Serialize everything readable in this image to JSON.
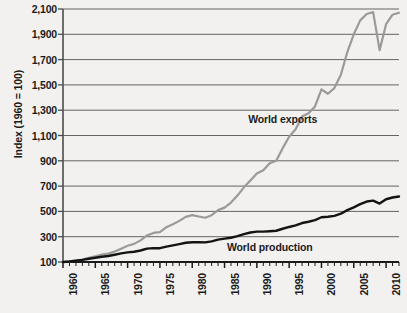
{
  "chart_data": {
    "type": "line",
    "title": "",
    "xlabel": "",
    "ylabel": "Index (1960 = 100)",
    "ylim": [
      100,
      2100
    ],
    "xlim": [
      1960,
      2012
    ],
    "yticks": [
      "100",
      "300",
      "500",
      "700",
      "900",
      "1,100",
      "1,300",
      "1,500",
      "1,700",
      "1,900",
      "2,100"
    ],
    "ytick_values": [
      100,
      300,
      500,
      700,
      900,
      1100,
      1300,
      1500,
      1700,
      1900,
      2100
    ],
    "xticks": [
      "1960",
      "1965",
      "1970",
      "1975",
      "1980",
      "1985",
      "1990",
      "1995",
      "2000",
      "2005",
      "2010"
    ],
    "xtick_values": [
      1960,
      1965,
      1970,
      1975,
      1980,
      1985,
      1990,
      1995,
      2000,
      2005,
      2010
    ],
    "minor_xtick_interval": 1,
    "grid": "horizontal",
    "legend": "inline-annotations",
    "x": [
      1960,
      1961,
      1962,
      1963,
      1964,
      1965,
      1966,
      1967,
      1968,
      1969,
      1970,
      1971,
      1972,
      1973,
      1974,
      1975,
      1976,
      1977,
      1978,
      1979,
      1980,
      1981,
      1982,
      1983,
      1984,
      1985,
      1986,
      1987,
      1988,
      1989,
      1990,
      1991,
      1992,
      1993,
      1994,
      1995,
      1996,
      1997,
      1998,
      1999,
      2000,
      2001,
      2002,
      2003,
      2004,
      2005,
      2006,
      2007,
      2008,
      2009,
      2010,
      2011,
      2012
    ],
    "series": [
      {
        "name": "World exports",
        "color": "#9a9a9a",
        "values": [
          100,
          105,
          112,
          120,
          133,
          145,
          158,
          166,
          183,
          205,
          228,
          243,
          271,
          310,
          330,
          336,
          375,
          398,
          425,
          457,
          470,
          460,
          450,
          470,
          510,
          530,
          570,
          625,
          690,
          745,
          800,
          825,
          880,
          900,
          1000,
          1090,
          1150,
          1250,
          1275,
          1330,
          1465,
          1430,
          1475,
          1580,
          1760,
          1900,
          2010,
          2060,
          2075,
          1775,
          1980,
          2055,
          2070
        ]
      },
      {
        "name": "World production",
        "color": "#141414",
        "values": [
          100,
          104,
          110,
          117,
          126,
          134,
          142,
          147,
          157,
          168,
          176,
          181,
          191,
          206,
          210,
          209,
          222,
          231,
          241,
          252,
          256,
          256,
          255,
          263,
          277,
          285,
          292,
          304,
          320,
          333,
          340,
          340,
          343,
          347,
          363,
          377,
          389,
          408,
          418,
          431,
          454,
          458,
          465,
          482,
          510,
          532,
          557,
          578,
          585,
          562,
          596,
          610,
          618
        ]
      }
    ],
    "annotations": [
      {
        "text": "World exports",
        "x": 1994,
        "y": 1230
      },
      {
        "text": "World production",
        "x": 1992,
        "y": 215
      }
    ]
  }
}
